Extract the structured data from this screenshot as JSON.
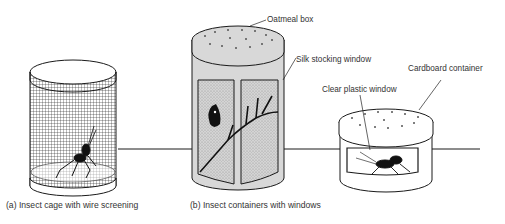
{
  "figure": {
    "panels": [
      {
        "id": "a",
        "caption": "(a) Insect cage with wire screening",
        "object": "wire-screen cylinder cage",
        "contents": "cricket"
      },
      {
        "id": "b",
        "caption": "(b) Insect containers with windows",
        "objects": [
          {
            "name": "oatmeal box container",
            "contents": "butterfly on branch"
          },
          {
            "name": "cardboard container",
            "contents": "cricket"
          }
        ]
      }
    ],
    "callouts": {
      "oatmeal_box": "Oatmeal box",
      "silk_window": "Silk stocking window",
      "cardboard_container": "Cardboard container",
      "plastic_window": "Clear plastic window"
    },
    "colors": {
      "line": "#1a1a1a",
      "shade": "#d8d8d8",
      "window_fill": "#cfcfcf",
      "background": "#ffffff"
    }
  }
}
